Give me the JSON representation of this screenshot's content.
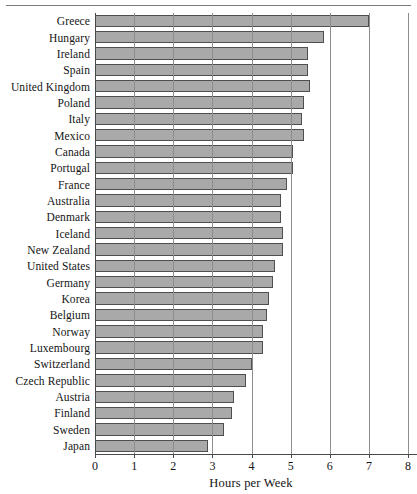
{
  "chart_data": {
    "type": "bar",
    "orientation": "horizontal",
    "title": "",
    "subtitle": "",
    "xlabel": "Hours per Week",
    "ylabel": "",
    "xlim": [
      0,
      8
    ],
    "xticks": [
      0,
      1,
      2,
      3,
      4,
      5,
      6,
      7,
      8
    ],
    "xtick_labels": [
      "0",
      "1",
      "2",
      "3",
      "4",
      "5",
      "6",
      "7",
      "8"
    ],
    "grid": true,
    "grid_axis": "x",
    "legend": false,
    "legend_position": "none",
    "bar_fill_color": "#a9a9a9",
    "bar_edge_color": "#4f4f4f",
    "axis_color": "#4a4a4a",
    "categories": [
      "Greece",
      "Hungary",
      "Ireland",
      "Spain",
      "United Kingdom",
      "Poland",
      "Italy",
      "Mexico",
      "Canada",
      "Portugal",
      "France",
      "Australia",
      "Denmark",
      "Iceland",
      "New Zealand",
      "United States",
      "Germany",
      "Korea",
      "Belgium",
      "Norway",
      "Luxembourg",
      "Switzerland",
      "Czech Republic",
      "Austria",
      "Finland",
      "Sweden",
      "Japan"
    ],
    "values": [
      7.0,
      5.85,
      5.45,
      5.45,
      5.5,
      5.35,
      5.3,
      5.35,
      5.05,
      5.05,
      4.9,
      4.75,
      4.75,
      4.8,
      4.8,
      4.6,
      4.55,
      4.45,
      4.4,
      4.3,
      4.3,
      4.0,
      3.85,
      3.55,
      3.5,
      3.3,
      2.9
    ]
  }
}
